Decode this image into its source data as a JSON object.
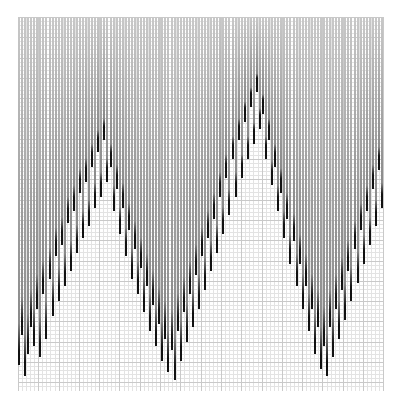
{
  "figure": {
    "title": "",
    "background_color": "#ffffff",
    "width": 396,
    "height": 404
  },
  "plot": {
    "left": 18,
    "top": 17,
    "width": 366,
    "height": 374,
    "grid": true,
    "grid_minor_color": "#e3e3e3",
    "grid_major_color": "#c9c9c9",
    "grid_minor_step": 4.06,
    "grid_major_step": 20.3
  },
  "chart_data": {
    "type": "bar",
    "title": "",
    "xlabel": "",
    "ylabel": "",
    "xlim": [
      0,
      120
    ],
    "ylim": [
      0,
      100
    ],
    "grid": true,
    "legend": null,
    "orientation": "vertical-hanging",
    "bar_width_px": 2,
    "bar_pitch_px": 3.05,
    "colors": {
      "bar_top": "#c8c8c8",
      "bar_mid": "#8a8a8a",
      "bar_tip": "#111111"
    },
    "categories": [
      1,
      2,
      3,
      4,
      5,
      6,
      7,
      8,
      9,
      10,
      11,
      12,
      13,
      14,
      15,
      16,
      17,
      18,
      19,
      20,
      21,
      22,
      23,
      24,
      25,
      26,
      27,
      28,
      29,
      30,
      31,
      32,
      33,
      34,
      35,
      36,
      37,
      38,
      39,
      40,
      41,
      42,
      43,
      44,
      45,
      46,
      47,
      48,
      49,
      50,
      51,
      52,
      53,
      54,
      55,
      56,
      57,
      58,
      59,
      60,
      61,
      62,
      63,
      64,
      65,
      66,
      67,
      68,
      69,
      70,
      71,
      72,
      73,
      74,
      75,
      76,
      77,
      78,
      79,
      80,
      81,
      82,
      83,
      84,
      85,
      86,
      87,
      88,
      89,
      90,
      91,
      92,
      93,
      94,
      95,
      96,
      97,
      98,
      99,
      100,
      101,
      102,
      103,
      104,
      105,
      106,
      107,
      108,
      109,
      110,
      111,
      112,
      113,
      114,
      115,
      116,
      117,
      118,
      119,
      120
    ],
    "values": [
      93,
      85,
      96,
      90,
      83,
      88,
      78,
      91,
      74,
      86,
      70,
      80,
      64,
      76,
      61,
      72,
      55,
      68,
      52,
      63,
      47,
      59,
      44,
      56,
      40,
      51,
      36,
      48,
      33,
      44,
      40,
      52,
      46,
      58,
      51,
      64,
      57,
      70,
      62,
      74,
      67,
      79,
      72,
      84,
      77,
      88,
      82,
      92,
      86,
      95,
      89,
      97,
      84,
      92,
      79,
      87,
      74,
      83,
      69,
      78,
      64,
      73,
      59,
      68,
      54,
      63,
      48,
      58,
      43,
      53,
      38,
      48,
      33,
      43,
      28,
      38,
      24,
      34,
      20,
      30,
      26,
      38,
      33,
      45,
      40,
      52,
      47,
      59,
      54,
      66,
      60,
      72,
      66,
      78,
      72,
      84,
      78,
      90,
      83,
      94,
      88,
      96,
      83,
      91,
      78,
      86,
      73,
      81,
      68,
      76,
      62,
      71,
      57,
      66,
      52,
      61,
      46,
      56,
      41,
      51
    ]
  }
}
